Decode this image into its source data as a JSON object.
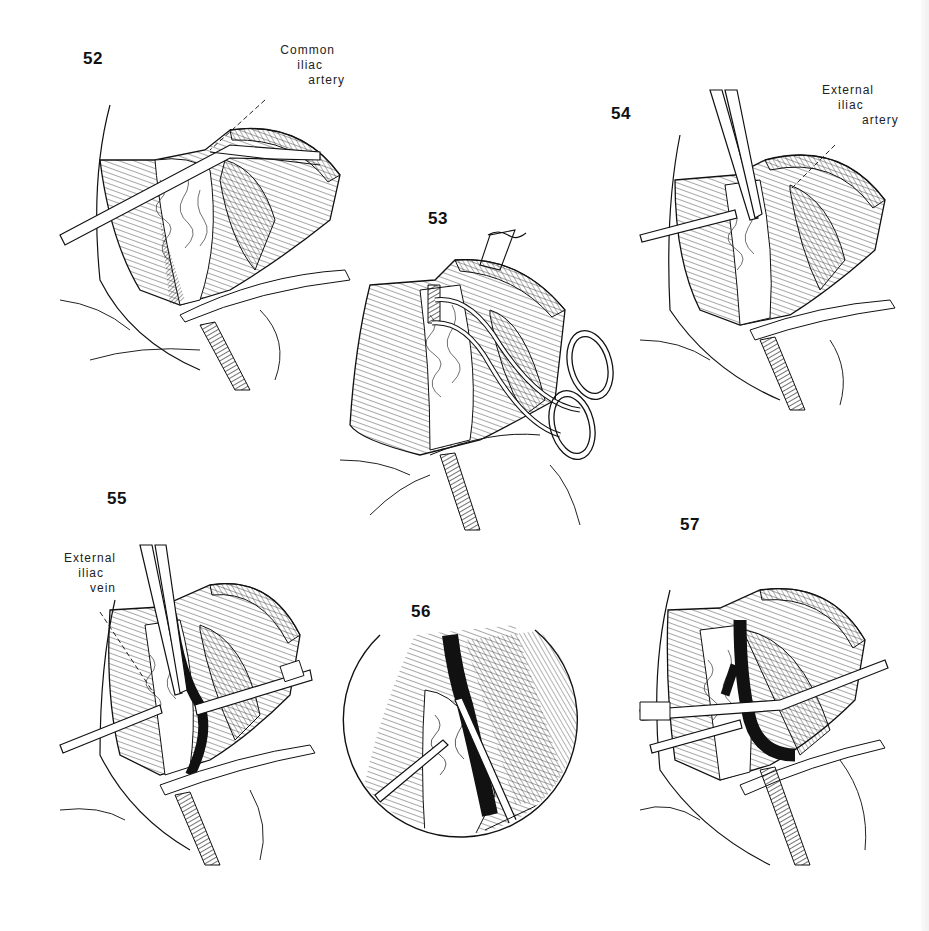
{
  "page": {
    "background": "#ffffff",
    "ink_color": "#111111"
  },
  "figures": [
    {
      "number": "52",
      "label": {
        "lines": [
          "Common",
          "iliac",
          "artery"
        ]
      },
      "depicts": "clamp applied across common iliac artery"
    },
    {
      "number": "53",
      "label": null,
      "depicts": "right-angle clamp passed behind ligated vessel with ring-handled instrument"
    },
    {
      "number": "54",
      "label": {
        "lines": [
          "External",
          "iliac",
          "artery"
        ]
      },
      "depicts": "forceps dissecting external iliac artery"
    },
    {
      "number": "55",
      "label": {
        "lines": [
          "External",
          "iliac",
          "vein"
        ]
      },
      "depicts": "retraction with exposure of external iliac vein"
    },
    {
      "number": "56",
      "label": null,
      "depicts": "circular magnified inset of vessel dissection"
    },
    {
      "number": "57",
      "label": null,
      "depicts": "graft vessel positioned with two instruments"
    }
  ]
}
